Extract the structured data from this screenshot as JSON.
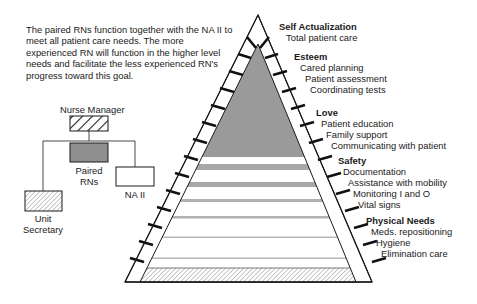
{
  "description": "The paired RNs function together with the NA II to meet all patient care needs. The more experienced RN will function in the higher level needs and facilitate the less experienced RN's progress toward this goal.",
  "org_chart": {
    "nurse_manager": "Nurse Manager",
    "paired_rns_line1": "Paired",
    "paired_rns_line2": "RNs",
    "na_ii": "NA II",
    "unit_secretary_line1": "Unit",
    "unit_secretary_line2": "Secretary"
  },
  "pyramid": {
    "levels": [
      {
        "title": "Self Actualization",
        "items": [
          "Total patient care"
        ]
      },
      {
        "title": "Esteem",
        "items": [
          "Cared planning",
          "Patient assessment",
          "Coordinating tests"
        ]
      },
      {
        "title": "Love",
        "items": [
          "Patient education",
          "Family support",
          "Communicating with patient"
        ]
      },
      {
        "title": "Safety",
        "items": [
          "Documentation",
          "Assistance with mobility",
          "Monitoring I and O",
          "Vital signs"
        ]
      },
      {
        "title": "Physical Needs",
        "items": [
          "Meds. repositioning",
          "Hygiene",
          "Elimination care"
        ]
      }
    ]
  },
  "colors": {
    "dark_fill": "#9a9a9a",
    "stripe": "#a8a8a8",
    "outline": "#1a1a1a"
  }
}
